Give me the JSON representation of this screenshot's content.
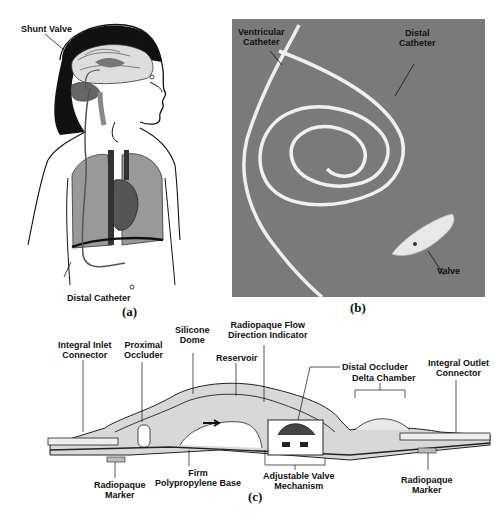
{
  "figure": {
    "panels": [
      {
        "id": "a",
        "caption": "(a)",
        "description": "Child anatomy illustration with shunt placement",
        "labels": {
          "shunt_valve": "Shunt Valve",
          "distal_catheter": "Distal Catheter"
        }
      },
      {
        "id": "b",
        "caption": "(b)",
        "description": "Photograph of shunt components",
        "labels": {
          "ventricular_catheter_line1": "Ventricular",
          "ventricular_catheter_line2": "Catheter",
          "distal_catheter_line1": "Distal",
          "distal_catheter_line2": "Catheter",
          "valve": "Valve"
        }
      },
      {
        "id": "c",
        "caption": "(c)",
        "description": "Cross-section of adjustable shunt valve",
        "labels": {
          "silicone_dome_line1": "Silicone",
          "silicone_dome_line2": "Dome",
          "radiopaque_flow_line1": "Radiopaque Flow",
          "radiopaque_flow_line2": "Direction Indicator",
          "reservoir": "Reservoir",
          "proximal_occluder_line1": "Proximal",
          "proximal_occluder_line2": "Occluder",
          "distal_occluder": "Distal Occluder",
          "delta_chamber": "Delta Chamber",
          "integral_inlet_line1": "Integral Inlet",
          "integral_inlet_line2": "Connector",
          "integral_outlet_line1": "Integral Outlet",
          "integral_outlet_line2": "Connector",
          "firm_base_line1": "Firm",
          "firm_base_line2": "Polypropylene Base",
          "adjustable_valve_line1": "Adjustable Valve",
          "adjustable_valve_line2": "Mechanism",
          "radiopaque_marker_left_line1": "Radiopaque",
          "radiopaque_marker_left_line2": "Marker",
          "radiopaque_marker_right_line1": "Radiopaque",
          "radiopaque_marker_right_line2": "Marker"
        }
      }
    ]
  }
}
